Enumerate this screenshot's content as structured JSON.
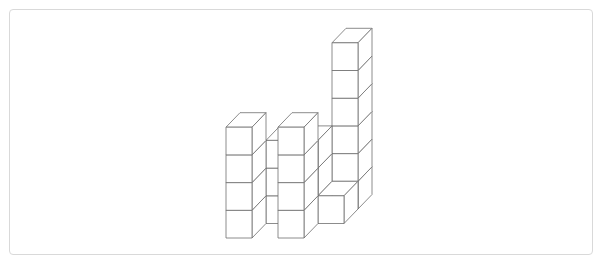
{
  "figure": {
    "cube_count": 23,
    "projection": {
      "origin_x": 226,
      "origin_y": 238,
      "cube_width": 26,
      "cube_height": 27.7,
      "depth_dx": 14,
      "depth_dy": -14.5
    },
    "stroke_color": "#6e6e6e",
    "fill_color": "#ffffff",
    "stacks": [
      {
        "col": 3,
        "depth": 2,
        "height": 6
      },
      {
        "col": 1,
        "depth": 1,
        "height": 3
      },
      {
        "col": 2,
        "depth": 1,
        "height": 3
      },
      {
        "col": 3,
        "depth": 1,
        "height": 1
      },
      {
        "col": 0,
        "depth": 0,
        "height": 4
      },
      {
        "col": 2,
        "depth": 0,
        "height": 4
      }
    ]
  }
}
